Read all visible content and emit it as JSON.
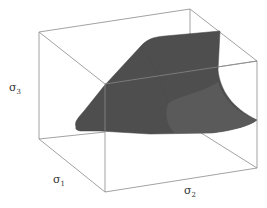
{
  "figure": {
    "type": "3d-surface-plot",
    "colors": {
      "box_edge": "#8a8a8a",
      "surface_fill": "#4e4e4e",
      "surface_shade": "#5c5c5c",
      "background": "#ffffff"
    },
    "axes": [
      {
        "id": "sigma3",
        "symbol": "σ",
        "subscript": "3",
        "position": "left-vertical"
      },
      {
        "id": "sigma1",
        "symbol": "σ",
        "subscript": "1",
        "position": "bottom-left-depth"
      },
      {
        "id": "sigma2",
        "symbol": "σ",
        "subscript": "2",
        "position": "bottom-front"
      }
    ]
  }
}
